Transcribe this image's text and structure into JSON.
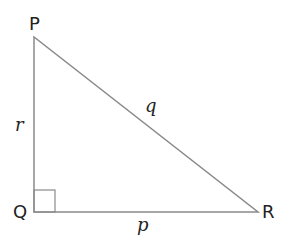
{
  "diagram": {
    "type": "right-triangle",
    "vertices": {
      "P": {
        "label": "P",
        "x": 34,
        "y": 37
      },
      "Q": {
        "label": "Q",
        "x": 34,
        "y": 212
      },
      "R": {
        "label": "R",
        "x": 258,
        "y": 212
      }
    },
    "sides": {
      "r": {
        "label": "r",
        "between": [
          "P",
          "Q"
        ]
      },
      "q": {
        "label": "q",
        "between": [
          "P",
          "R"
        ]
      },
      "p": {
        "label": "p",
        "between": [
          "Q",
          "R"
        ]
      }
    },
    "right_angle_at": "Q",
    "line_color": "#8a8a8a",
    "text_color": "#222222"
  }
}
